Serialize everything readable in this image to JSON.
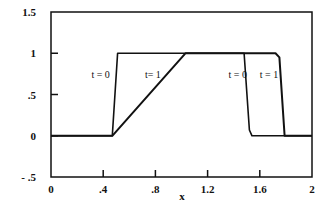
{
  "chart_data": {
    "type": "line",
    "title": "",
    "xlabel": "x",
    "ylabel": "",
    "xlim": [
      0,
      2
    ],
    "ylim": [
      -0.5,
      1.5
    ],
    "grid": false,
    "legend": "none (inline curve labels)",
    "x_ticks": [
      0,
      0.4,
      0.8,
      1.2,
      1.6,
      2
    ],
    "x_tick_labels": [
      "0",
      ".4",
      ".8",
      "1.2",
      "1.6",
      "2"
    ],
    "y_ticks": [
      -0.5,
      0,
      0.5,
      1,
      1.5
    ],
    "y_tick_labels": [
      "- .5",
      "0",
      ".5",
      "1",
      "1.5"
    ],
    "series": [
      {
        "name": "t = 0",
        "x": [
          0,
          0.47,
          0.51,
          1.48,
          1.52,
          1.54,
          2
        ],
        "y": [
          0,
          0,
          1,
          1,
          0.07,
          0,
          0
        ]
      },
      {
        "name": "t = 1",
        "x": [
          0,
          0.47,
          1.03,
          1.72,
          1.75,
          1.79,
          2
        ],
        "y": [
          0,
          0,
          1,
          1,
          0.95,
          0,
          0
        ]
      }
    ],
    "annotations": [
      {
        "text": "t = 0",
        "x": 0.31,
        "y": 0.7
      },
      {
        "text": "t= 1",
        "x": 0.72,
        "y": 0.7
      },
      {
        "text": "t = 0",
        "x": 1.36,
        "y": 0.7
      },
      {
        "text": "t = 1",
        "x": 1.6,
        "y": 0.7
      }
    ]
  }
}
